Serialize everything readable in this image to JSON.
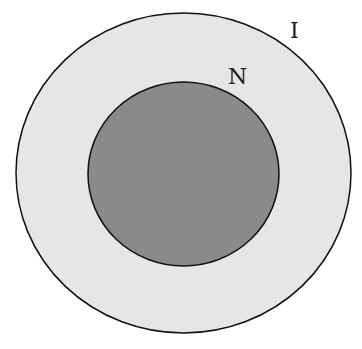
{
  "diagram": {
    "type": "nested-sets",
    "outer_set": {
      "label": "I",
      "fill": "#e6e6e6",
      "stroke": "#111111"
    },
    "inner_set": {
      "label": "N",
      "fill": "#8a8a8a",
      "stroke": "#111111"
    }
  }
}
